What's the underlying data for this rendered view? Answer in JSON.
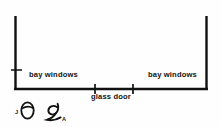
{
  "diagram": {
    "kind": "architectural-floor-plan-sketch",
    "background_color": "#fefefe",
    "ink_color": "#111111",
    "labels": {
      "bay_windows_left": "bay windows",
      "bay_windows_right": "bay windows",
      "glass_door": "glass door"
    },
    "walls": [
      {
        "name": "left-wall",
        "orientation": "vertical",
        "x": 15,
        "y1": 16,
        "y2": 90
      },
      {
        "name": "right-wall",
        "orientation": "vertical",
        "x": 207,
        "y1": 16,
        "y2": 90
      },
      {
        "name": "bottom-wall",
        "orientation": "horizontal",
        "y": 89,
        "x1": 15,
        "x2": 207
      }
    ],
    "tick_marks": [
      {
        "name": "left-wall-tick",
        "orientation": "horizontal",
        "x": 15,
        "y": 70
      },
      {
        "name": "glass-door-tick-start",
        "orientation": "vertical",
        "x": 95,
        "y": 89
      },
      {
        "name": "glass-door-tick-end",
        "orientation": "vertical",
        "x": 133,
        "y": 89
      }
    ],
    "annotations": {
      "letter_j": "J",
      "letter_a": "A",
      "glyph_1_name": "handwritten-theta-glyph",
      "glyph_2_name": "handwritten-spiral-glyph"
    }
  }
}
